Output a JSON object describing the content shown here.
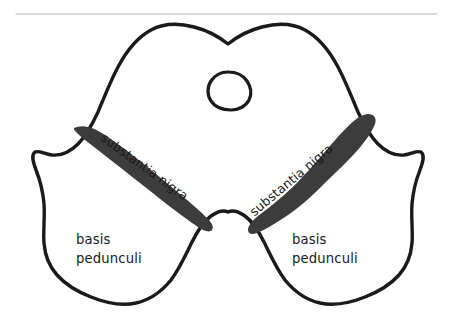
{
  "figure": {
    "kind": "anatomical-line-drawing",
    "background_color": "#ffffff",
    "outline_color": "#1a1a1a",
    "shaded_band_color": "#3c3c3c",
    "rule_color": "#b4b4b4",
    "outline_stroke_width": 3.4,
    "aqueduct_stroke_width": 3.2
  },
  "top_rule": {
    "name": "horizontal-rule",
    "x1": 16,
    "x2": 437,
    "y": 14,
    "thickness": 1.2,
    "color": "#b4b4b4"
  },
  "labels": {
    "substantia_nigra_left": {
      "text": "substantia nigra",
      "x": 102,
      "y": 137,
      "rotation": 36,
      "font_size": 12.6
    },
    "substantia_nigra_right": {
      "text": "substantia nigra",
      "x": 252,
      "y": 214,
      "rotation": -40,
      "font_size": 12.6
    },
    "basis_pedunculi_left": {
      "line1": "basis",
      "line2": "pedunculi",
      "x": 76,
      "y1": 240,
      "y2": 259,
      "font_size": 13.2
    },
    "basis_pedunculi_right": {
      "line1": "basis",
      "line2": "pedunculi",
      "x": 292,
      "y1": 240,
      "y2": 259,
      "font_size": 13.2
    }
  },
  "structures": {
    "midbrain_outline": {
      "name": "midbrain-outline",
      "path": "M 228 44 C 238 36 250 30 262 27 C 277 23 292 23 305 30 C 320 38 330 52 338 67 C 346 82 352 98 358 112 C 364 125 370 136 378 144 C 386 152 394 156 404 155 C 412 154 417 150 421 152 C 425 155 423 162 420 170 C 416 180 413 192 412 204 C 411 218 413 231 412 243 C 411 256 407 266 399 275 C 390 285 378 292 365 297 C 350 303 334 306 320 303 C 306 300 294 291 285 280 C 276 268 270 254 264 242 C 258 230 252 221 245 216 C 238 211 232 210 228 212 C 224 210 218 211 211 216 C 204 221 198 230 192 242 C 186 254 180 268 171 280 C 162 291 150 300 136 303 C 122 306 106 303 91 297 C 78 292 66 285 57 275 C 49 266 45 256 44 243 C 43 231 45 218 44 204 C 43 192 40 180 36 170 C 33 162 31 155 35 152 C 39 150 44 154 52 155 C 62 156 70 152 78 144 C 86 136 92 125 98 112 C 104 98 110 82 118 67 C 126 52 136 38 151 30 C 164 23 179 23 194 27 C 206 30 218 36 228 44 Z"
    },
    "cerebral_aqueduct": {
      "name": "cerebral-aqueduct",
      "path": "M 228 72 C 236 72 243 75 247 81 C 251 87 252 94 249 100 C 246 106 239 110 231 110 C 222 110 215 107 211 101 C 207 95 207 87 211 81 C 215 75 221 72 228 72 Z"
    },
    "substantia_nigra_left_band": {
      "name": "substantia-nigra-left-band",
      "path": "M 77 127 C 84 125 92 127 100 132 C 112 139 126 150 140 161 C 154 172 168 184 181 195 C 192 204 201 212 208 219 C 212 223 214 227 212 230 C 209 233 204 231 198 227 C 189 221 177 212 164 202 C 150 191 135 179 121 168 C 107 157 94 147 85 140 C 78 134 73 130 74 128 Z"
    },
    "substantia_nigra_right_band": {
      "name": "substantia-nigra-right-band",
      "path": "M 368 114 C 374 114 377 118 375 124 C 372 132 365 142 356 152 C 347 162 337 171 328 180 C 320 188 313 195 306 201 C 298 208 290 214 282 219 C 273 225 264 230 257 233 C 252 235 248 234 248 230 C 248 226 252 221 258 216 C 266 210 275 203 284 195 C 293 187 301 179 309 170 C 318 160 327 149 336 139 C 345 129 353 121 359 117 C 363 115 366 114 368 114 Z"
    }
  }
}
